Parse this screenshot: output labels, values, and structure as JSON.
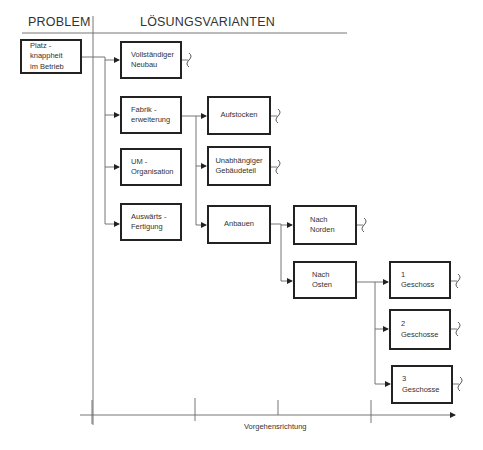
{
  "header": {
    "problem_label": "PROBLEM",
    "solutions_label": "LÖSUNGSVARIANTEN"
  },
  "problem": {
    "label": "Platz -\nknappheit\nim Betrieb"
  },
  "level1": [
    {
      "id": "neubau",
      "label": "Vollständiger\nNeubau",
      "continues": true
    },
    {
      "id": "fabrik",
      "label": "Fabrik -\nerweiterung",
      "continues": false
    },
    {
      "id": "um",
      "label": "UM -\nOrganisation",
      "continues": false
    },
    {
      "id": "auswaerts",
      "label": "Auswärts -\nFertigung",
      "continues": false
    }
  ],
  "level2": [
    {
      "id": "aufstocken",
      "label": "Aufstocken",
      "parent": "fabrik",
      "continues": true
    },
    {
      "id": "unabhaengig",
      "label": "Unabhängiger\nGebäudeteil",
      "parent": "fabrik",
      "continues": true
    },
    {
      "id": "anbauen",
      "label": "Anbauen",
      "parent": "fabrik",
      "continues": false
    }
  ],
  "level3": [
    {
      "id": "norden",
      "label": "Nach\nNorden",
      "parent": "anbauen",
      "continues": true
    },
    {
      "id": "osten",
      "label": "Nach\nOsten",
      "parent": "anbauen",
      "continues": false
    }
  ],
  "level4": [
    {
      "id": "g1",
      "label": "1\nGeschoss",
      "parent": "osten",
      "continues": true
    },
    {
      "id": "g2",
      "label": "2\nGeschosse",
      "parent": "osten",
      "continues": true
    },
    {
      "id": "g3",
      "label": "3\nGeschosse",
      "parent": "osten",
      "continues": true
    }
  ],
  "axis": {
    "label": "Vorgehensrichtung"
  },
  "colors": {
    "line": "#555555",
    "box_border": "#222222",
    "text": "#333333"
  }
}
